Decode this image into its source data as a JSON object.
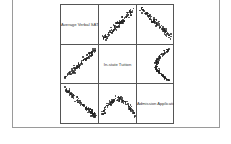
{
  "chart_data": {
    "type": "scatter",
    "subtype": "scatterplot_matrix",
    "title": "",
    "variables": [
      "Average Verbal SAT",
      "In-state Tuition",
      "Admission Applications"
    ],
    "diagonal_labels": [
      "Average Verbal SAT",
      "In-state Tuition",
      "Admission Applicatio"
    ],
    "grid": false,
    "legend": null,
    "panels": [
      {
        "row": 0,
        "col": 1,
        "x_var": "In-state Tuition",
        "y_var": "Average Verbal SAT",
        "trend": "positive",
        "note": "dense cluster left-center, rising to upper right"
      },
      {
        "row": 0,
        "col": 2,
        "x_var": "Admission Applications",
        "y_var": "Average Verbal SAT",
        "trend": "negative",
        "note": "dense cluster upper-left to lower-right"
      },
      {
        "row": 1,
        "col": 0,
        "x_var": "Average Verbal SAT",
        "y_var": "In-state Tuition",
        "trend": "positive",
        "note": "rising diagonal band, dense cluster at bottom"
      },
      {
        "row": 1,
        "col": 2,
        "x_var": "Admission Applications",
        "y_var": "In-state Tuition",
        "trend": "curved",
        "note": "C-shaped band along right side"
      },
      {
        "row": 2,
        "col": 0,
        "x_var": "Average Verbal SAT",
        "y_var": "Admission Applications",
        "trend": "negative",
        "note": "dense cluster upper-left descending to lower-right"
      },
      {
        "row": 2,
        "col": 1,
        "x_var": "In-state Tuition",
        "y_var": "Admission Applications",
        "trend": "arch",
        "note": "arch shape with points dropping at right"
      }
    ]
  },
  "labels": {
    "var1": "Average Verbal SAT",
    "var2": "In-state Tuition",
    "var3": "Admission Applicatio"
  },
  "colors": {
    "points": "#222222",
    "grid_lines": "#555555",
    "frame": "#9a9a9a"
  }
}
